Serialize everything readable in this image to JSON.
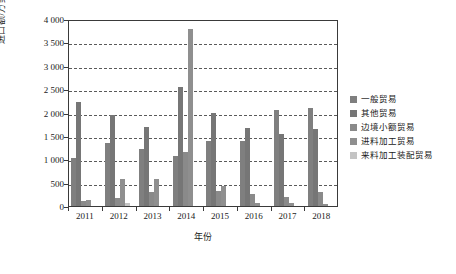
{
  "chart_data": {
    "type": "bar",
    "title": "",
    "subtitle": "",
    "xlabel": "年份",
    "ylabel": "进口额/万美元",
    "categories": [
      "2011",
      "2012",
      "2013",
      "2014",
      "2015",
      "2016",
      "2017",
      "2018"
    ],
    "ylim": [
      0,
      4000
    ],
    "ytick_labels": [
      "0",
      "500",
      "1 000",
      "1 500",
      "2 000",
      "2 500",
      "3 000",
      "3 500",
      "4 000"
    ],
    "ytick_values": [
      0,
      500,
      1000,
      1500,
      2000,
      2500,
      3000,
      3500,
      4000
    ],
    "grid": true,
    "grid_style": "dashed-horizontal",
    "legend_position": "right",
    "series": [
      {
        "name": "一般贸易",
        "color": "#7f7f7f",
        "values": [
          1020,
          1340,
          1230,
          1080,
          1390,
          1400,
          2060,
          2100
        ]
      },
      {
        "name": "其他贸易",
        "color": "#767676",
        "values": [
          2230,
          1940,
          1690,
          2540,
          1990,
          1670,
          1530,
          1640
        ]
      },
      {
        "name": "边境小额贸易",
        "color": "#8a8a8a",
        "values": [
          100,
          175,
          310,
          1165,
          320,
          265,
          195,
          290
        ]
      },
      {
        "name": "进料加工贸易",
        "color": "#8f8f8f",
        "values": [
          125,
          580,
          575,
          3790,
          420,
          75,
          55,
          35
        ]
      },
      {
        "name": "来料加工装配贸易",
        "color": "#c4c4c4",
        "values": [
          0,
          75,
          0,
          0,
          0,
          0,
          0,
          0
        ]
      }
    ]
  },
  "axes": {
    "y_axis_title": "进口额/万美元",
    "x_axis_title": "年份"
  }
}
